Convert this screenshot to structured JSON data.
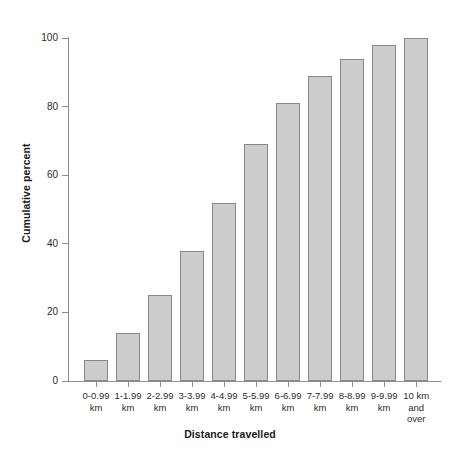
{
  "chart_data": {
    "type": "bar",
    "title": "",
    "xlabel": "Distance travelled",
    "ylabel": "Cumulative percent",
    "categories": [
      "0-0.99\nkm",
      "1-1.99\nkm",
      "2-2.99\nkm",
      "3-3.99\nkm",
      "4-4.99\nkm",
      "5-5.99\nkm",
      "6-6.99\nkm",
      "7-7.99\nkm",
      "8-8.99\nkm",
      "9-9.99\nkm",
      "10 km\nand\nover"
    ],
    "category_lines": [
      [
        "0-0.99",
        "km"
      ],
      [
        "1-1.99",
        "km"
      ],
      [
        "2-2.99",
        "km"
      ],
      [
        "3-3.99",
        "km"
      ],
      [
        "4-4.99",
        "km"
      ],
      [
        "5-5.99",
        "km"
      ],
      [
        "6-6.99",
        "km"
      ],
      [
        "7-7.99",
        "km"
      ],
      [
        "8-8.99",
        "km"
      ],
      [
        "9-9.99",
        "km"
      ],
      [
        "10 km",
        "and",
        "over"
      ]
    ],
    "values": [
      6,
      14,
      25,
      38,
      52,
      69,
      81,
      89,
      94,
      98,
      100
    ],
    "ylim": [
      0,
      100
    ],
    "yticks": [
      0,
      20,
      40,
      60,
      80,
      100
    ],
    "ytick_labels": [
      "0",
      "20",
      "40",
      "60",
      "80",
      "100"
    ],
    "grid": false,
    "legend": null,
    "bar_fill_color": "#cdcdcd",
    "bar_edge_color": "#8a8a8a",
    "axis_color": "#8c8c8c"
  }
}
